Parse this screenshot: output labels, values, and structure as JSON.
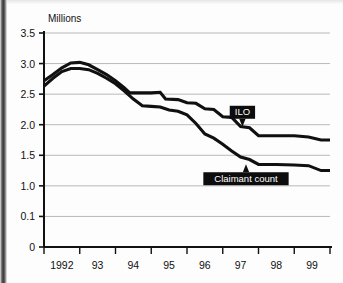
{
  "chart_data": {
    "type": "line",
    "title": "",
    "subtitle": "",
    "ylabel": "Millions",
    "xlabel": "",
    "ytick_labels": [
      "3.5",
      "3.0",
      "2.5",
      "2.0",
      "1.5",
      "1.0",
      "0.1",
      "0"
    ],
    "ytick_values": [
      3.5,
      3.0,
      2.5,
      2.0,
      1.5,
      1.0,
      0.5,
      0.0
    ],
    "xtick_labels": [
      "1992",
      "93",
      "94",
      "95",
      "96",
      "97",
      "98",
      "99"
    ],
    "xlim": [
      1992.0,
      2000.0
    ],
    "ylim": [
      0.0,
      3.5
    ],
    "grid": "horizontal",
    "legend_position": "annotations",
    "line_color": "#101010",
    "grid_color": "#b9b9b9",
    "axis_color": "#111111",
    "background_color": "#fdfdfd",
    "annotations": [
      {
        "label": "ILO",
        "pointer": "down",
        "target_x": 1997.55,
        "target_y": 1.95
      },
      {
        "label": "Claimant count",
        "pointer": "up",
        "target_x": 1997.65,
        "target_y": 1.37
      }
    ],
    "series": [
      {
        "name": "ILO",
        "x": [
          1992.0,
          1992.25,
          1992.5,
          1992.75,
          1993.0,
          1993.25,
          1993.5,
          1993.75,
          1994.0,
          1994.25,
          1994.4,
          1994.75,
          1995.0,
          1995.25,
          1995.4,
          1995.75,
          1996.0,
          1996.25,
          1996.5,
          1996.75,
          1997.0,
          1997.25,
          1997.5,
          1997.75,
          1998.0,
          1998.5,
          1999.0,
          1999.4,
          1999.75,
          2000.0
        ],
        "values": [
          2.72,
          2.82,
          2.93,
          3.01,
          3.02,
          2.98,
          2.9,
          2.82,
          2.72,
          2.6,
          2.52,
          2.52,
          2.52,
          2.53,
          2.42,
          2.41,
          2.36,
          2.35,
          2.26,
          2.25,
          2.13,
          2.12,
          1.97,
          1.95,
          1.82,
          1.82,
          1.82,
          1.8,
          1.75,
          1.75
        ]
      },
      {
        "name": "Claimant count",
        "x": [
          1992.0,
          1992.25,
          1992.5,
          1992.75,
          1993.0,
          1993.25,
          1993.5,
          1993.75,
          1994.0,
          1994.25,
          1994.5,
          1994.75,
          1995.0,
          1995.25,
          1995.5,
          1995.75,
          1996.0,
          1996.25,
          1996.5,
          1996.75,
          1997.0,
          1997.25,
          1997.5,
          1997.75,
          1998.0,
          1998.5,
          1999.0,
          1999.4,
          1999.75,
          2000.0
        ],
        "values": [
          2.63,
          2.76,
          2.87,
          2.92,
          2.92,
          2.9,
          2.84,
          2.76,
          2.67,
          2.55,
          2.42,
          2.31,
          2.3,
          2.29,
          2.24,
          2.22,
          2.16,
          2.02,
          1.85,
          1.78,
          1.68,
          1.57,
          1.47,
          1.43,
          1.35,
          1.35,
          1.34,
          1.33,
          1.25,
          1.25
        ]
      }
    ]
  }
}
